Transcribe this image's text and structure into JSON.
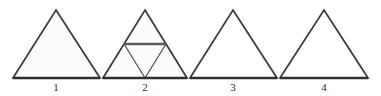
{
  "figure": {
    "background_color": "#ffffff",
    "stroke_color": "#3a3a3c",
    "base_stroke_color": "#2e2e30",
    "subdivision_stroke_color": "#4a4a4c",
    "midline_stroke_color": "#5a5a5c",
    "fill_shaded": "#fbfbfa",
    "fill_plain": "#ffffff",
    "width": 381,
    "height": 96
  },
  "triangles": [
    {
      "id": "triangle-1",
      "label": "1",
      "shape": "equilateral-triangle",
      "subdivided": false,
      "filled": true,
      "apex": {
        "x": 56,
        "y": 10
      },
      "base_left": {
        "x": 13,
        "y": 78
      },
      "base_right": {
        "x": 100,
        "y": 78
      },
      "label_x": 56,
      "label_y": 81
    },
    {
      "id": "triangle-2",
      "label": "2",
      "shape": "equilateral-triangle",
      "subdivided": true,
      "subdivision": "midpoint-four-parts",
      "filled": true,
      "apex": {
        "x": 145,
        "y": 10
      },
      "base_left": {
        "x": 103,
        "y": 78
      },
      "base_right": {
        "x": 187,
        "y": 78
      },
      "label_x": 145,
      "label_y": 81
    },
    {
      "id": "triangle-3",
      "label": "3",
      "shape": "equilateral-triangle",
      "subdivided": false,
      "filled": false,
      "apex": {
        "x": 233,
        "y": 10
      },
      "base_left": {
        "x": 190,
        "y": 78
      },
      "base_right": {
        "x": 277,
        "y": 78
      },
      "label_x": 233,
      "label_y": 81
    },
    {
      "id": "triangle-4",
      "label": "4",
      "shape": "equilateral-triangle",
      "subdivided": false,
      "filled": false,
      "apex": {
        "x": 324,
        "y": 10
      },
      "base_left": {
        "x": 280,
        "y": 78
      },
      "base_right": {
        "x": 368,
        "y": 78
      },
      "label_x": 324,
      "label_y": 81
    }
  ]
}
